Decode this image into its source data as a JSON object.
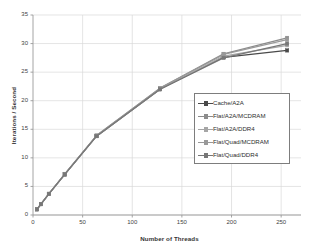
{
  "chart_data": {
    "type": "line",
    "title": "",
    "xlabel": "Number of Threads",
    "ylabel": "Iterations / Second",
    "xlim": [
      0,
      270
    ],
    "ylim": [
      0,
      35
    ],
    "xticks": [
      0,
      50,
      100,
      150,
      200,
      250
    ],
    "yticks": [
      0,
      5,
      10,
      15,
      20,
      25,
      30,
      35
    ],
    "grid": true,
    "legend_position": "center-right",
    "x": [
      4,
      8,
      16,
      32,
      64,
      128,
      192,
      256
    ],
    "series": [
      {
        "name": "Cache/A2A",
        "color": "#4a4a4a",
        "marker": "square",
        "values": [
          1.0,
          1.9,
          3.7,
          7.1,
          13.8,
          22.0,
          27.6,
          28.8
        ]
      },
      {
        "name": "Flat/A2A/MCDRAM",
        "color": "#8c8c8c",
        "marker": "square",
        "values": [
          1.0,
          1.9,
          3.7,
          7.1,
          13.9,
          22.2,
          28.2,
          31.0
        ]
      },
      {
        "name": "Flat/A2A/DDR4",
        "color": "#a6a6a6",
        "marker": "square",
        "values": [
          1.0,
          1.9,
          3.7,
          7.1,
          13.8,
          22.0,
          27.8,
          29.7
        ]
      },
      {
        "name": "Flat/Quad/MCDRAM",
        "color": "#999999",
        "marker": "square",
        "values": [
          1.0,
          1.9,
          3.7,
          7.2,
          13.9,
          22.2,
          28.1,
          30.7
        ]
      },
      {
        "name": "Flat/Quad/DDR4",
        "color": "#777777",
        "marker": "square",
        "values": [
          1.0,
          1.9,
          3.7,
          7.1,
          13.8,
          22.0,
          27.5,
          30.0
        ]
      }
    ]
  },
  "axes": {
    "y_title": "Iterations / Second",
    "x_title": "Number of Threads",
    "y_tick_labels": [
      "0",
      "5",
      "10",
      "15",
      "20",
      "25",
      "30",
      "35"
    ],
    "x_tick_labels": [
      "0",
      "50",
      "100",
      "150",
      "200",
      "250"
    ]
  },
  "legend": {
    "items": [
      {
        "label": "Cache/A2A"
      },
      {
        "label": "Flat/A2A/MCDRAM"
      },
      {
        "label": "Flat/A2A/DDR4"
      },
      {
        "label": "Flat/Quad/MCDRAM"
      },
      {
        "label": "Flat/Quad/DDR4"
      }
    ]
  },
  "style": {
    "grid_color": "#d9d9d9",
    "axis_color": "#9a9a9a",
    "text_color": "#3a3a3a",
    "background": "#ffffff"
  }
}
